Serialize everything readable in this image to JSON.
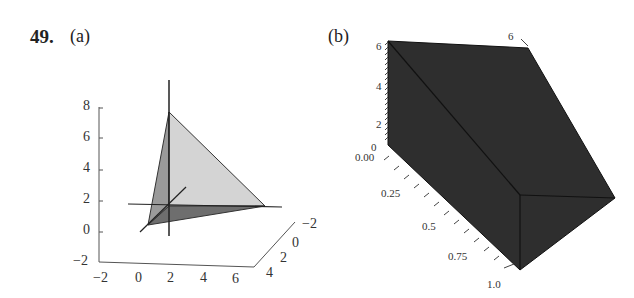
{
  "problem": {
    "number": "49.",
    "part_a_label": "(a)",
    "part_b_label": "(b)"
  },
  "figure_a": {
    "description": "3D tetrahedron with coordinate axes",
    "z_ticks": [
      "8",
      "6",
      "4",
      "2",
      "0",
      "−2"
    ],
    "x_ticks": [
      "−2",
      "0",
      "2",
      "4",
      "6"
    ],
    "y_ticks": [
      "−2",
      "0",
      "2",
      "4"
    ],
    "colors": {
      "light_face": "#d0d0d0",
      "mid_face": "#9a9a9a",
      "dark_face": "#6e6e6e",
      "edge": "#222222"
    }
  },
  "figure_b": {
    "description": "3D dark solid region",
    "vertical_ticks": [
      "6",
      "4",
      "2",
      "0"
    ],
    "depth_ticks": [
      "0.00",
      "0.25",
      "0.5",
      "0.75",
      "1.0"
    ],
    "corner_tick": "6",
    "colors": {
      "solid": "#2e2e2e",
      "edge": "#111111"
    }
  }
}
